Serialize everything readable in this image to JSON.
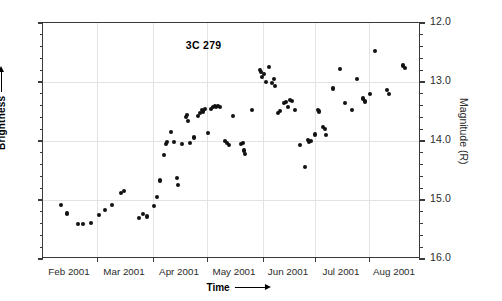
{
  "chart_data": {
    "type": "scatter",
    "title": "3C 279",
    "xlabel": "Time",
    "ylabel": "Magnitude (R)",
    "ylabel_left": "Brightness",
    "y_axis_inverted": true,
    "ylim": [
      12.0,
      16.0
    ],
    "y_ticks": [
      "12.0",
      "13.0",
      "14.0",
      "15.0",
      "16.0"
    ],
    "y_tick_values": [
      12.0,
      13.0,
      14.0,
      15.0,
      16.0
    ],
    "y_minor_step": 0.2,
    "grid": true,
    "legend": "none",
    "xlim_days": [
      0,
      189
    ],
    "x_tick_days": [
      0,
      27,
      55,
      82,
      110,
      136,
      163,
      189
    ],
    "x_tick_labels": [
      "Feb 2001",
      "Mar 2001",
      "Apr 2001",
      "May 2001",
      "Jun 2001",
      "Jul 2001",
      "Aug 2001"
    ],
    "x_label_positions_days": [
      13.5,
      41,
      68.5,
      96,
      123,
      149.5,
      176
    ],
    "series": [
      {
        "name": "3C 279 R-band light curve",
        "marker": "filled-circle",
        "color": "#111111",
        "points": [
          [
            9.0,
            15.08
          ],
          [
            12.0,
            15.23
          ],
          [
            17.5,
            15.4
          ],
          [
            20.0,
            15.4
          ],
          [
            24.0,
            15.39
          ],
          [
            28.0,
            15.25
          ],
          [
            31.0,
            15.17
          ],
          [
            34.5,
            15.08
          ],
          [
            39.0,
            14.88
          ],
          [
            40.5,
            14.85
          ],
          [
            48.0,
            15.3
          ],
          [
            50.0,
            15.24
          ],
          [
            52.0,
            15.28
          ],
          [
            55.5,
            15.1
          ],
          [
            57.0,
            14.95
          ],
          [
            58.5,
            14.67
          ],
          [
            60.5,
            14.24
          ],
          [
            61.5,
            14.05
          ],
          [
            62.0,
            14.02
          ],
          [
            64.0,
            13.85
          ],
          [
            65.5,
            14.02
          ],
          [
            67.0,
            14.63
          ],
          [
            67.5,
            14.74
          ],
          [
            69.5,
            14.05
          ],
          [
            71.5,
            13.6
          ],
          [
            72.0,
            13.56
          ],
          [
            72.5,
            13.66
          ],
          [
            73.5,
            14.03
          ],
          [
            75.5,
            13.94
          ],
          [
            77.5,
            13.57
          ],
          [
            78.5,
            13.52
          ],
          [
            79.5,
            13.48
          ],
          [
            80.0,
            13.5
          ],
          [
            81.0,
            13.46
          ],
          [
            82.5,
            13.87
          ],
          [
            84.0,
            13.46
          ],
          [
            85.0,
            13.42
          ],
          [
            85.8,
            13.4
          ],
          [
            86.5,
            13.43
          ],
          [
            87.5,
            13.4
          ],
          [
            88.5,
            13.42
          ],
          [
            91.0,
            14.0
          ],
          [
            92.0,
            14.04
          ],
          [
            93.0,
            14.07
          ],
          [
            95.0,
            13.57
          ],
          [
            99.0,
            14.05
          ],
          [
            99.8,
            14.04
          ],
          [
            100.5,
            14.16
          ],
          [
            100.8,
            14.22
          ],
          [
            104.5,
            13.48
          ],
          [
            108.5,
            12.79
          ],
          [
            109.0,
            12.83
          ],
          [
            109.5,
            12.91
          ],
          [
            110.5,
            12.86
          ],
          [
            111.5,
            13.0
          ],
          [
            113.0,
            12.75
          ],
          [
            114.5,
            13.02
          ],
          [
            115.5,
            12.95
          ],
          [
            116.0,
            13.07
          ],
          [
            117.5,
            13.52
          ],
          [
            118.5,
            13.49
          ],
          [
            120.5,
            13.35
          ],
          [
            121.5,
            13.34
          ],
          [
            122.5,
            13.42
          ],
          [
            123.5,
            13.3
          ],
          [
            124.5,
            13.32
          ],
          [
            126.0,
            13.47
          ],
          [
            128.5,
            14.07
          ],
          [
            131.0,
            14.44
          ],
          [
            132.5,
            13.98
          ],
          [
            133.0,
            14.02
          ],
          [
            134.0,
            14.0
          ],
          [
            136.0,
            13.89
          ],
          [
            137.5,
            13.48
          ],
          [
            138.0,
            13.5
          ],
          [
            140.0,
            13.76
          ],
          [
            141.0,
            13.8
          ],
          [
            141.5,
            13.9
          ],
          [
            145.0,
            13.11
          ],
          [
            148.5,
            12.78
          ],
          [
            151.0,
            13.36
          ],
          [
            154.5,
            13.47
          ],
          [
            157.0,
            12.95
          ],
          [
            160.0,
            13.28
          ],
          [
            161.0,
            13.33
          ],
          [
            163.5,
            13.21
          ],
          [
            166.0,
            12.48
          ],
          [
            172.0,
            13.13
          ],
          [
            173.0,
            13.2
          ],
          [
            180.0,
            12.72
          ],
          [
            180.8,
            12.76
          ]
        ]
      }
    ]
  }
}
